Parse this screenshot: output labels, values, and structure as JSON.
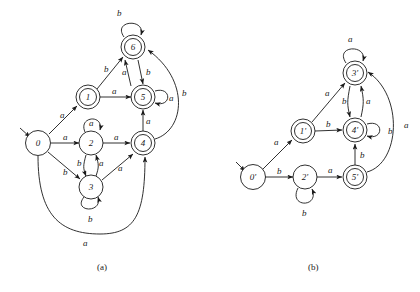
{
  "figure": {
    "captions": [
      {
        "id": "caption-a",
        "text": "(a)"
      },
      {
        "id": "caption-b",
        "text": "(b)"
      }
    ]
  },
  "automaton_a": {
    "caption": "(a)",
    "start_state": "0",
    "states": [
      {
        "label": "0",
        "accepting": false,
        "x": 38,
        "y": 143
      },
      {
        "label": "1",
        "accepting": true,
        "x": 88,
        "y": 97
      },
      {
        "label": "2",
        "accepting": false,
        "x": 91,
        "y": 143
      },
      {
        "label": "3",
        "accepting": false,
        "x": 91,
        "y": 187
      },
      {
        "label": "4",
        "accepting": true,
        "x": 143,
        "y": 143
      },
      {
        "label": "5",
        "accepting": true,
        "x": 143,
        "y": 97
      },
      {
        "label": "6",
        "accepting": true,
        "x": 133,
        "y": 47
      }
    ],
    "transitions": [
      {
        "from": "0",
        "to": "1",
        "symbol": "a"
      },
      {
        "from": "0",
        "to": "2",
        "symbol": "a"
      },
      {
        "from": "0",
        "to": "3",
        "symbol": "b"
      },
      {
        "from": "0",
        "to": "4",
        "symbol": "a"
      },
      {
        "from": "1",
        "to": "6",
        "symbol": "b"
      },
      {
        "from": "1",
        "to": "5",
        "symbol": "a"
      },
      {
        "from": "2",
        "to": "2",
        "symbol": "a"
      },
      {
        "from": "2",
        "to": "3",
        "symbol": "b"
      },
      {
        "from": "2",
        "to": "4",
        "symbol": "a"
      },
      {
        "from": "3",
        "to": "2",
        "symbol": "a"
      },
      {
        "from": "3",
        "to": "3",
        "symbol": "b"
      },
      {
        "from": "3",
        "to": "4",
        "symbol": "a"
      },
      {
        "from": "4",
        "to": "5",
        "symbol": "a"
      },
      {
        "from": "4",
        "to": "6",
        "symbol": "b"
      },
      {
        "from": "5",
        "to": "5",
        "symbol": "a"
      },
      {
        "from": "5",
        "to": "6",
        "symbol": "a"
      },
      {
        "from": "6",
        "to": "6",
        "symbol": "b"
      },
      {
        "from": "6",
        "to": "5",
        "symbol": "b"
      }
    ]
  },
  "automaton_b": {
    "caption": "(b)",
    "start_state": "0'",
    "states": [
      {
        "label": "0'",
        "accepting": false,
        "x": 253,
        "y": 177
      },
      {
        "label": "1'",
        "accepting": true,
        "x": 303,
        "y": 131
      },
      {
        "label": "2'",
        "accepting": false,
        "x": 305,
        "y": 177
      },
      {
        "label": "3'",
        "accepting": true,
        "x": 355,
        "y": 73
      },
      {
        "label": "4'",
        "accepting": true,
        "x": 355,
        "y": 130
      },
      {
        "label": "5'",
        "accepting": true,
        "x": 355,
        "y": 177
      }
    ],
    "transitions": [
      {
        "from": "0'",
        "to": "1'",
        "symbol": "a"
      },
      {
        "from": "0'",
        "to": "2'",
        "symbol": "b"
      },
      {
        "from": "1'",
        "to": "3'",
        "symbol": "a"
      },
      {
        "from": "1'",
        "to": "4'",
        "symbol": "b"
      },
      {
        "from": "2'",
        "to": "2'",
        "symbol": "b"
      },
      {
        "from": "2'",
        "to": "5'",
        "symbol": "a"
      },
      {
        "from": "3'",
        "to": "3'",
        "symbol": "a"
      },
      {
        "from": "3'",
        "to": "4'",
        "symbol": "b"
      },
      {
        "from": "4'",
        "to": "3'",
        "symbol": "a"
      },
      {
        "from": "4'",
        "to": "4'",
        "symbol": "b"
      },
      {
        "from": "5'",
        "to": "4'",
        "symbol": "b"
      },
      {
        "from": "5'",
        "to": "3'",
        "symbol": "a"
      }
    ]
  },
  "edge_labels_a": {
    "l1": "b",
    "l2": "b",
    "l3": "a",
    "l4": "b",
    "l5": "a",
    "l6": "a",
    "l7": "a",
    "l8": "b",
    "l9": "a",
    "l10": "a",
    "l11": "a",
    "l12": "a",
    "l13": "b",
    "l14": "a",
    "l15": "a",
    "l16": "b",
    "l17": "b",
    "l18": "a"
  },
  "edge_labels_b": {
    "m1": "a",
    "m2": "a",
    "m3": "b",
    "m4": "a",
    "m5": "b",
    "m6": "b",
    "m7": "a",
    "m8": "a",
    "m9": "b",
    "m10": "b",
    "m11": "b",
    "m12": "a"
  },
  "node_text_a": {
    "n0": "0",
    "n1": "1",
    "n2": "2",
    "n3": "3",
    "n4": "4",
    "n5": "5",
    "n6": "6"
  },
  "node_text_b": {
    "n0": "0'",
    "n1": "1'",
    "n2": "2'",
    "n3": "3'",
    "n4": "4'",
    "n5": "5'"
  },
  "colors": {
    "ink": "#1a1a1a",
    "paper": "#ffffff"
  }
}
